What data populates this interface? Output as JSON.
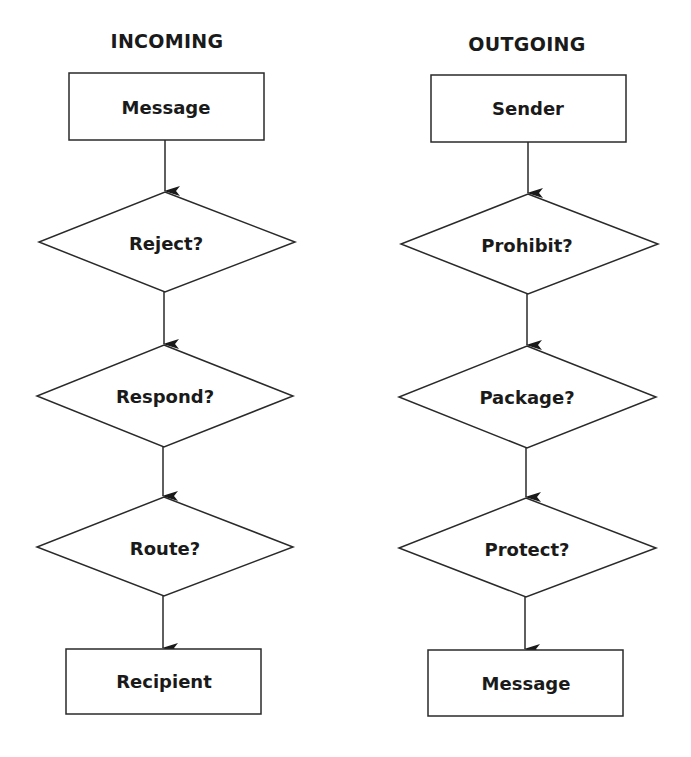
{
  "columns": [
    {
      "title": "INCOMING",
      "start": "Message",
      "decisions": [
        "Reject?",
        "Respond?",
        "Route?"
      ],
      "end": "Recipient"
    },
    {
      "title": "OUTGOING",
      "start": "Sender",
      "decisions": [
        "Prohibit?",
        "Package?",
        "Protect?"
      ],
      "end": "Message"
    }
  ],
  "colors": {
    "stroke": "#2a2a2a",
    "text": "#1a1a1a",
    "background": "#ffffff"
  }
}
